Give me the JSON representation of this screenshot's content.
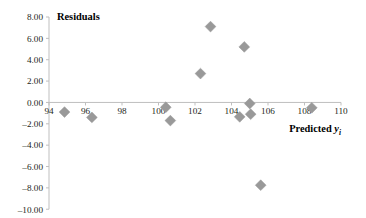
{
  "chart_data": {
    "type": "scatter",
    "title": "",
    "ylabel": "Residuals",
    "xlabel": "Predicted y",
    "xlabel_subscript": "i",
    "xlim": [
      94,
      110
    ],
    "ylim": [
      -10,
      8
    ],
    "xticks": [
      94,
      96,
      98,
      100,
      102,
      104,
      106,
      108,
      110
    ],
    "xtick_labels": [
      "94",
      "96",
      "98",
      "100",
      "102",
      "104",
      "106",
      "108",
      "110"
    ],
    "yticks": [
      8,
      6,
      4,
      2,
      0,
      -2,
      -4,
      -6,
      -8,
      -10
    ],
    "ytick_labels": [
      "8.00",
      "6.00",
      "4.00",
      "2.00",
      "0.00",
      "–2.00",
      "–4.00",
      "–6.00",
      "–8.00",
      "–10.00"
    ],
    "grid": false,
    "legend": false,
    "marker": "diamond",
    "marker_color": "#999999",
    "marker_size": 5.4,
    "axis_color": "#bfbfbf",
    "zero_line": 0,
    "points": [
      {
        "x": 94.85,
        "y": -0.9
      },
      {
        "x": 96.35,
        "y": -1.4
      },
      {
        "x": 100.4,
        "y": -0.45
      },
      {
        "x": 100.65,
        "y": -1.7
      },
      {
        "x": 102.3,
        "y": 2.7
      },
      {
        "x": 102.85,
        "y": 7.1
      },
      {
        "x": 104.45,
        "y": -1.35
      },
      {
        "x": 104.7,
        "y": 5.2
      },
      {
        "x": 105.0,
        "y": -0.1
      },
      {
        "x": 105.05,
        "y": -1.1
      },
      {
        "x": 105.6,
        "y": -7.75
      },
      {
        "x": 108.4,
        "y": -0.5
      }
    ]
  },
  "geometry": {
    "plot_left": 49,
    "plot_right": 341,
    "y_top_value_px": 17,
    "y_px_per_unit": 10.68,
    "zero_y_px": 113.4,
    "x_px_per_unit": 18.25
  }
}
